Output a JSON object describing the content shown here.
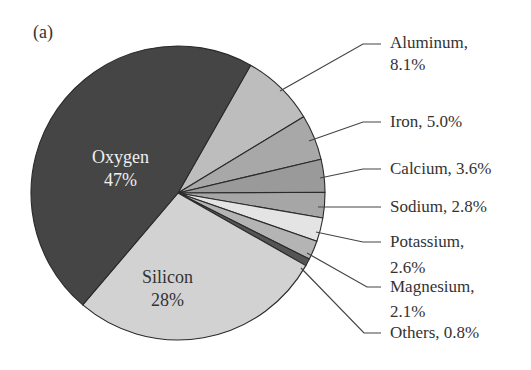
{
  "chart_data": {
    "type": "pie",
    "title": "",
    "panel_label": "(a)",
    "start_angle_deg": -60.4,
    "direction": "clockwise-from-oxygen-end",
    "slices": [
      {
        "name": "Oxygen",
        "value": 47,
        "label_line1": "Oxygen",
        "label_line2": "47%",
        "color": "#454545",
        "label_pos": "inside"
      },
      {
        "name": "Silicon",
        "value": 28,
        "label_line1": "Silicon",
        "label_line2": "28%",
        "color": "#d2d2d2",
        "label_pos": "inside"
      },
      {
        "name": "Aluminum",
        "value": 8.1,
        "label_line1": "Aluminum,",
        "label_line2": "8.1%",
        "color": "#bdbdbd",
        "label_pos": "outside"
      },
      {
        "name": "Iron",
        "value": 5.0,
        "label_line1": "Iron, 5.0%",
        "label_line2": "",
        "color": "#a8a8a8",
        "label_pos": "outside"
      },
      {
        "name": "Calcium",
        "value": 3.6,
        "label_line1": "Calcium, 3.6%",
        "label_line2": "",
        "color": "#9a9a9a",
        "label_pos": "outside"
      },
      {
        "name": "Sodium",
        "value": 2.8,
        "label_line1": "Sodium, 2.8%",
        "label_line2": "",
        "color": "#a6a6a6",
        "label_pos": "outside"
      },
      {
        "name": "Potassium",
        "value": 2.6,
        "label_line1": "Potassium,",
        "label_line2": "2.6%",
        "color": "#e4e4e4",
        "label_pos": "outside"
      },
      {
        "name": "Magnesium",
        "value": 2.1,
        "label_line1": "Magnesium,",
        "label_line2": "2.1%",
        "color": "#b4b4b4",
        "label_pos": "outside"
      },
      {
        "name": "Others",
        "value": 0.8,
        "label_line1": "Others, 0.8%",
        "label_line2": "",
        "color": "#555555",
        "label_pos": "outside"
      }
    ],
    "legend": "none (leader-line labels)",
    "units": "%"
  },
  "labels": {
    "panel": "(a)",
    "oxygen": {
      "name": "Oxygen",
      "pct": "47%"
    },
    "silicon": {
      "name": "Silicon",
      "pct": "28%"
    },
    "aluminum": {
      "line1": "Aluminum,",
      "line2": "8.1%"
    },
    "iron": {
      "line1": "Iron, 5.0%"
    },
    "calcium": {
      "line1": "Calcium, 3.6%"
    },
    "sodium": {
      "line1": "Sodium, 2.8%"
    },
    "potassium": {
      "line1": "Potassium,",
      "line2": "2.6%"
    },
    "magnesium": {
      "line1": "Magnesium,",
      "line2": "2.1%"
    },
    "others": {
      "line1": "Others, 0.8%"
    }
  }
}
